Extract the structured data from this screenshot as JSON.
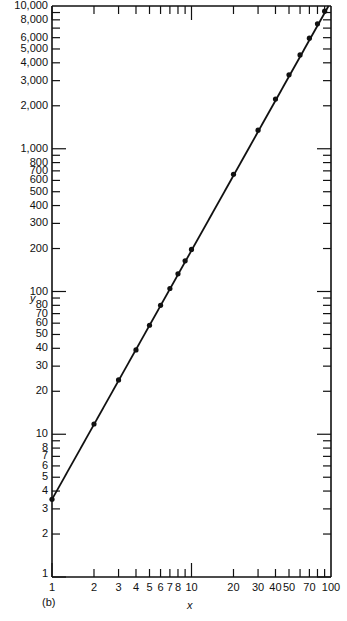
{
  "chart_data": {
    "type": "scatter",
    "subtype": "log-log line with markers",
    "panel_label": "(b)",
    "title": "",
    "xlabel": "x",
    "ylabel": "y",
    "xscale": "log",
    "yscale": "log",
    "xlim": [
      1,
      100
    ],
    "ylim": [
      1,
      10000
    ],
    "grid": false,
    "legend": null,
    "x_tick_labels": [
      "1",
      "2",
      "3",
      "4",
      "5",
      "6",
      "7",
      "8",
      "10",
      "20",
      "30",
      "40",
      "50",
      "70",
      "100"
    ],
    "y_tick_labels": [
      "1",
      "2",
      "3",
      "4",
      "5",
      "6",
      "7",
      "8",
      "10",
      "20",
      "30",
      "40",
      "50",
      "60",
      "70",
      "80",
      "100",
      "200",
      "300",
      "400",
      "500",
      "600",
      "700",
      "800",
      "1,000",
      "2,000",
      "3,000",
      "4,000",
      "5,000",
      "6,000",
      "8,000",
      "10,000"
    ],
    "series": [
      {
        "name": "y = 3.5 x^1.75",
        "x": [
          1,
          2,
          3,
          4,
          5,
          6,
          7,
          8,
          9,
          10,
          20,
          30,
          40,
          50,
          60,
          70,
          80,
          90
        ],
        "y": [
          3.5,
          11.8,
          24,
          39,
          58,
          80,
          105,
          133,
          164,
          197,
          663,
          1349,
          2230,
          3300,
          4540,
          5950,
          7500,
          9200
        ]
      }
    ],
    "fit_line": {
      "x_start": 1,
      "y_start": 3.5,
      "x_end": 96,
      "y_end": 10000,
      "slope": 1.75
    }
  }
}
